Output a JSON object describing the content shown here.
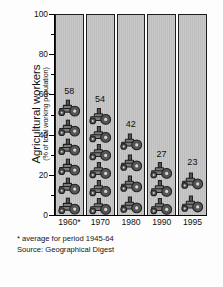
{
  "chart_data": {
    "type": "bar",
    "subtype": "pictogram-bar",
    "title": "",
    "xlabel": "",
    "ylabel": "Agricultural workers",
    "ylabel_sub": "(% of total working population)",
    "categories": [
      "1960*",
      "1970",
      "1980",
      "1990",
      "1995"
    ],
    "values": [
      58,
      54,
      42,
      27,
      23
    ],
    "value_labels": [
      "58",
      "54",
      "42",
      "27",
      "23"
    ],
    "ylim": [
      0,
      100
    ],
    "ytick_labels": [
      "0",
      "20",
      "40",
      "60",
      "80",
      "100"
    ],
    "ytick_values": [
      0,
      20,
      40,
      60,
      80,
      100
    ],
    "yminor_values": [
      10,
      30,
      50,
      70,
      90
    ],
    "grid": false,
    "legend": "none",
    "icon": "tractor-icon",
    "icon_unit_value": 10,
    "icon_counts": [
      6,
      6,
      4,
      3,
      2
    ],
    "notes": [
      "* average for period 1945-64",
      "Source: Geographical Digest"
    ],
    "colors": {
      "background": "#fdfdfd",
      "column_fill": "#c4c4c4",
      "icon": "#6e6e6e",
      "icon_outline": "#1d1d1d",
      "axis": "#000000",
      "text": "#111111"
    }
  }
}
